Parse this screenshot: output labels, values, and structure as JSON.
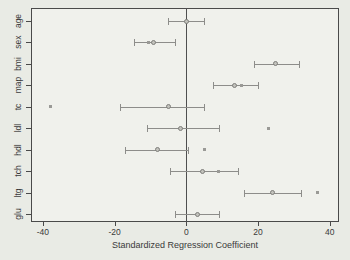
{
  "colors": {
    "page_bg": "#e9ebe5",
    "plot_bg": "#f0f1ec",
    "frame": "#4a4a4a",
    "element_gray": "#8d8d8a",
    "text": "#3a3a3a"
  },
  "chart_data": {
    "type": "scatter",
    "subtype": "horizontal-coefficient-plot-with-error-bars",
    "title": "",
    "xlabel": "Standardized Regression Coefficient",
    "ylabel": "",
    "xlim": [
      -43.3,
      42.6
    ],
    "x_ticks": [
      -40,
      -20,
      0,
      20,
      40
    ],
    "grid": false,
    "legend": "none",
    "zero_reference_line": 0,
    "categories": [
      "age",
      "sex",
      "bmi",
      "map",
      "tc",
      "ldl",
      "hdl",
      "tch",
      "ltg",
      "glu"
    ],
    "series": [
      {
        "name": "estimate-with-confidence-interval",
        "marker": "circle",
        "points": [
          {
            "category": "age",
            "value": 0,
            "ci_low": -5,
            "ci_high": 5
          },
          {
            "category": "sex",
            "value": -9,
            "ci_low": -14.5,
            "ci_high": -3
          },
          {
            "category": "bmi",
            "value": 25,
            "ci_low": 19,
            "ci_high": 31.5
          },
          {
            "category": "map",
            "value": 13.5,
            "ci_low": 7.5,
            "ci_high": 20
          },
          {
            "category": "tc",
            "value": -5,
            "ci_low": -18.5,
            "ci_high": 5
          },
          {
            "category": "ldl",
            "value": -1.5,
            "ci_low": -11,
            "ci_high": 9
          },
          {
            "category": "hdl",
            "value": -8,
            "ci_low": -17,
            "ci_high": 0.5
          },
          {
            "category": "tch",
            "value": 4.5,
            "ci_low": -4.5,
            "ci_high": 14.5
          },
          {
            "category": "ltg",
            "value": 24,
            "ci_low": 16,
            "ci_high": 32
          },
          {
            "category": "glu",
            "value": 3,
            "ci_low": -3,
            "ci_high": 9
          }
        ]
      },
      {
        "name": "secondary-point-estimate",
        "marker": "small-square",
        "points": [
          {
            "category": "sex",
            "value": -10.5
          },
          {
            "category": "map",
            "value": 15.5
          },
          {
            "category": "tc",
            "value": -38
          },
          {
            "category": "ldl",
            "value": 23
          },
          {
            "category": "hdl",
            "value": 5
          },
          {
            "category": "tch",
            "value": 9
          },
          {
            "category": "ltg",
            "value": 36.5
          }
        ]
      }
    ]
  }
}
